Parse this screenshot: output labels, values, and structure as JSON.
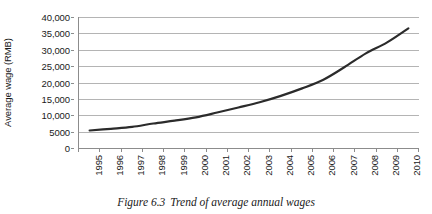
{
  "caption": {
    "number": "Figure 6.3",
    "text": "Trend of average annual wages"
  },
  "chart_data": {
    "type": "line",
    "title": "",
    "xlabel": "",
    "ylabel": "Average wage (RMB)",
    "ylim": [
      0,
      40000
    ],
    "ytick_values": [
      0,
      5000,
      10000,
      15000,
      20000,
      25000,
      30000,
      35000,
      40000
    ],
    "ytick_labels": [
      "0",
      "5000",
      "10,000",
      "15,000",
      "20,000",
      "25,000",
      "30,000",
      "35,000",
      "40,000"
    ],
    "grid": true,
    "legend": "none",
    "line_color": "#2b2b2b",
    "gridline_color": "#b4b4b4",
    "axis_color": "#8c8c8c",
    "categories": [
      "1995",
      "1996",
      "1997",
      "1998",
      "1999",
      "2000",
      "2001",
      "2002",
      "2003",
      "2004",
      "2005",
      "2006",
      "2007",
      "2008",
      "2009",
      "2010"
    ],
    "values": [
      5348,
      5864,
      6444,
      7479,
      8346,
      9371,
      10834,
      12373,
      13969,
      15920,
      18200,
      20856,
      24721,
      28898,
      32244,
      36539
    ]
  }
}
